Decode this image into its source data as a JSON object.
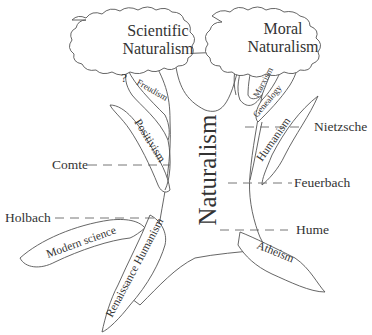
{
  "diagram": {
    "type": "tree",
    "colors": {
      "stroke": "#555555",
      "text": "#333333",
      "background": "#ffffff"
    },
    "clouds": [
      {
        "id": "scientific",
        "line1": "Scientific",
        "line2": "Naturalism"
      },
      {
        "id": "moral",
        "line1": "Moral",
        "line2": "Naturalism"
      }
    ],
    "trunk": {
      "label": "Naturalism"
    },
    "branches": {
      "freudism": "Freudism",
      "question": "?",
      "positivism": "Positivism",
      "marxism": "Marxism",
      "genealogy": "Genealogy",
      "humanism": "Humanism",
      "modern_science": "Modern science",
      "renaissance_humanism": "Renaissance Humanism",
      "atheism": "Atheism"
    },
    "thinkers": {
      "comte": "Comte",
      "holbach": "Holbach",
      "nietzsche": "Nietzsche",
      "feuerbach": "Feuerbach",
      "hume": "Hume"
    }
  }
}
